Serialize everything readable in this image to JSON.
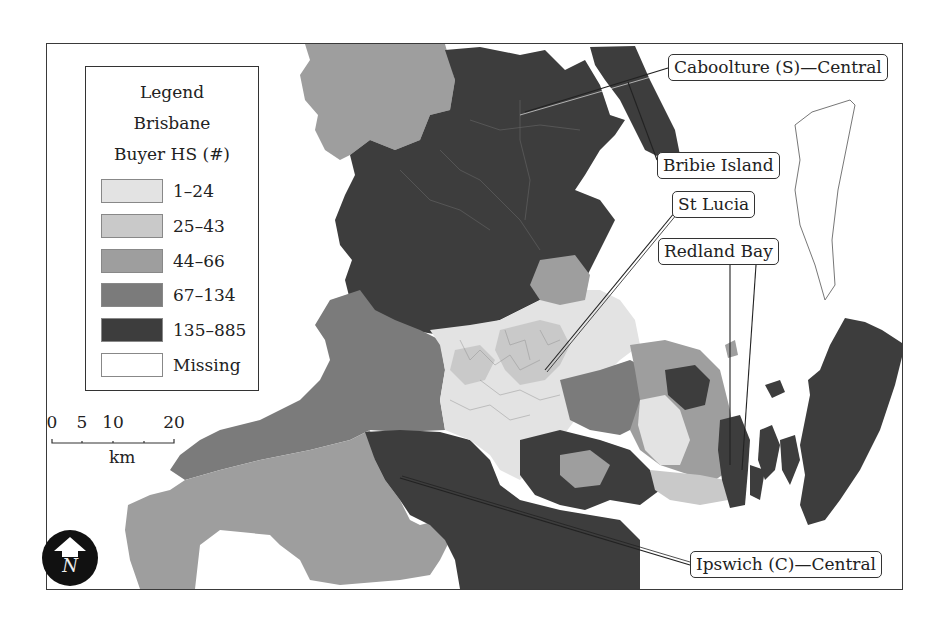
{
  "legend": {
    "title_lines": [
      "Legend",
      "Brisbane",
      "Buyer HS (#)"
    ],
    "classes": [
      {
        "label": "1–24",
        "color": "#e3e3e3"
      },
      {
        "label": "25–43",
        "color": "#c9c9c9"
      },
      {
        "label": "44–66",
        "color": "#9e9e9e"
      },
      {
        "label": "67–134",
        "color": "#7b7b7b"
      },
      {
        "label": "135–885",
        "color": "#3d3d3d"
      },
      {
        "label": "Missing",
        "color": "#ffffff"
      }
    ]
  },
  "scale_bar": {
    "ticks": [
      "0",
      "5",
      "10",
      "20"
    ],
    "unit": "km"
  },
  "north_arrow": {
    "letter": "N",
    "icon": "north-arrow-icon"
  },
  "callouts": {
    "caboolture": "Caboolture (S)—Central",
    "bribie": "Bribie Island",
    "st_lucia": "St Lucia",
    "redland": "Redland Bay",
    "ipswich": "Ipswich (C)—Central"
  },
  "colors": {
    "class_1": "#e3e3e3",
    "class_2": "#c9c9c9",
    "class_3": "#9e9e9e",
    "class_4": "#7b7b7b",
    "class_5": "#3d3d3d",
    "frame": "#3a3a3a"
  }
}
